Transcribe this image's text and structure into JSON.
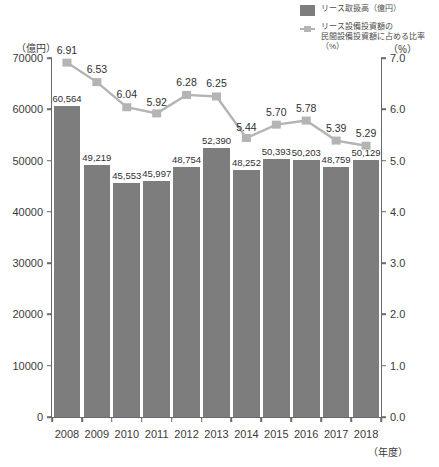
{
  "legend": {
    "bar_label": "リース取扱高（億円）",
    "line_label": "リース設備投資額の\n民間設備投資額に占める比率（%）"
  },
  "axes": {
    "left_unit": "（億円）",
    "right_unit": "（%）",
    "x_caption": "（年度）"
  },
  "chart_data": {
    "type": "bar",
    "title": "",
    "subtitle": "",
    "xlabel": "（年度）",
    "ylabel": "（億円）",
    "y2label": "（%）",
    "categories": [
      "2008",
      "2009",
      "2010",
      "2011",
      "2012",
      "2013",
      "2014",
      "2015",
      "2016",
      "2017",
      "2018"
    ],
    "ylim": [
      0,
      70000
    ],
    "y2lim": [
      0.0,
      7.0
    ],
    "yticks": [
      "70000",
      "60000",
      "50000",
      "40000",
      "30000",
      "20000",
      "10000",
      "0"
    ],
    "ytick_values": [
      70000,
      60000,
      50000,
      40000,
      30000,
      20000,
      10000,
      0
    ],
    "y2ticks": [
      "7.0",
      "6.0",
      "5.0",
      "4.0",
      "3.0",
      "2.0",
      "1.0",
      "0.0"
    ],
    "y2tick_values": [
      7.0,
      6.0,
      5.0,
      4.0,
      3.0,
      2.0,
      1.0,
      0.0
    ],
    "grid": false,
    "legend_position": "top-right",
    "series": [
      {
        "name": "リース取扱高（億円）",
        "type": "bar",
        "axis": "left",
        "color": "#7d7d7d",
        "values": [
          60564,
          49219,
          45553,
          45997,
          48754,
          52390,
          48252,
          50393,
          50203,
          48759,
          50129
        ],
        "labels": [
          "60,564",
          "49,219",
          "45,553",
          "45,997",
          "48,754",
          "52,390",
          "48,252",
          "50,393",
          "50,203",
          "48,759",
          "50,129"
        ]
      },
      {
        "name": "リース設備投資額の民間設備投資額に占める比率（%）",
        "type": "line",
        "axis": "right",
        "color": "#b4b4b4",
        "values": [
          6.91,
          6.53,
          6.04,
          5.92,
          6.28,
          6.25,
          5.44,
          5.7,
          5.78,
          5.39,
          5.29
        ],
        "labels": [
          "6.91",
          "6.53",
          "6.04",
          "5.92",
          "6.28",
          "6.25",
          "5.44",
          "5.70",
          "5.78",
          "5.39",
          "5.29"
        ]
      }
    ]
  }
}
